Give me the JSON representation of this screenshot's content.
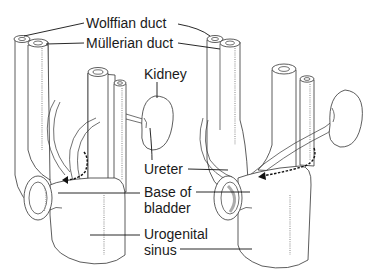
{
  "figure": {
    "panels": [
      {
        "id": "left",
        "stage": "early"
      },
      {
        "id": "right",
        "stage": "later"
      }
    ]
  },
  "labels": {
    "wolffian_duct": "Wolffian duct",
    "mullerian_duct": "Müllerian duct",
    "kidney": "Kidney",
    "ureter": "Ureter",
    "base_of_bladder_line1": "Base of",
    "base_of_bladder_line2": "bladder",
    "urogenital_sinus_line1": "Urogenital",
    "urogenital_sinus_line2": "sinus"
  },
  "colors": {
    "line": "#333333",
    "text": "#1a1a1a",
    "background": "#ffffff"
  }
}
